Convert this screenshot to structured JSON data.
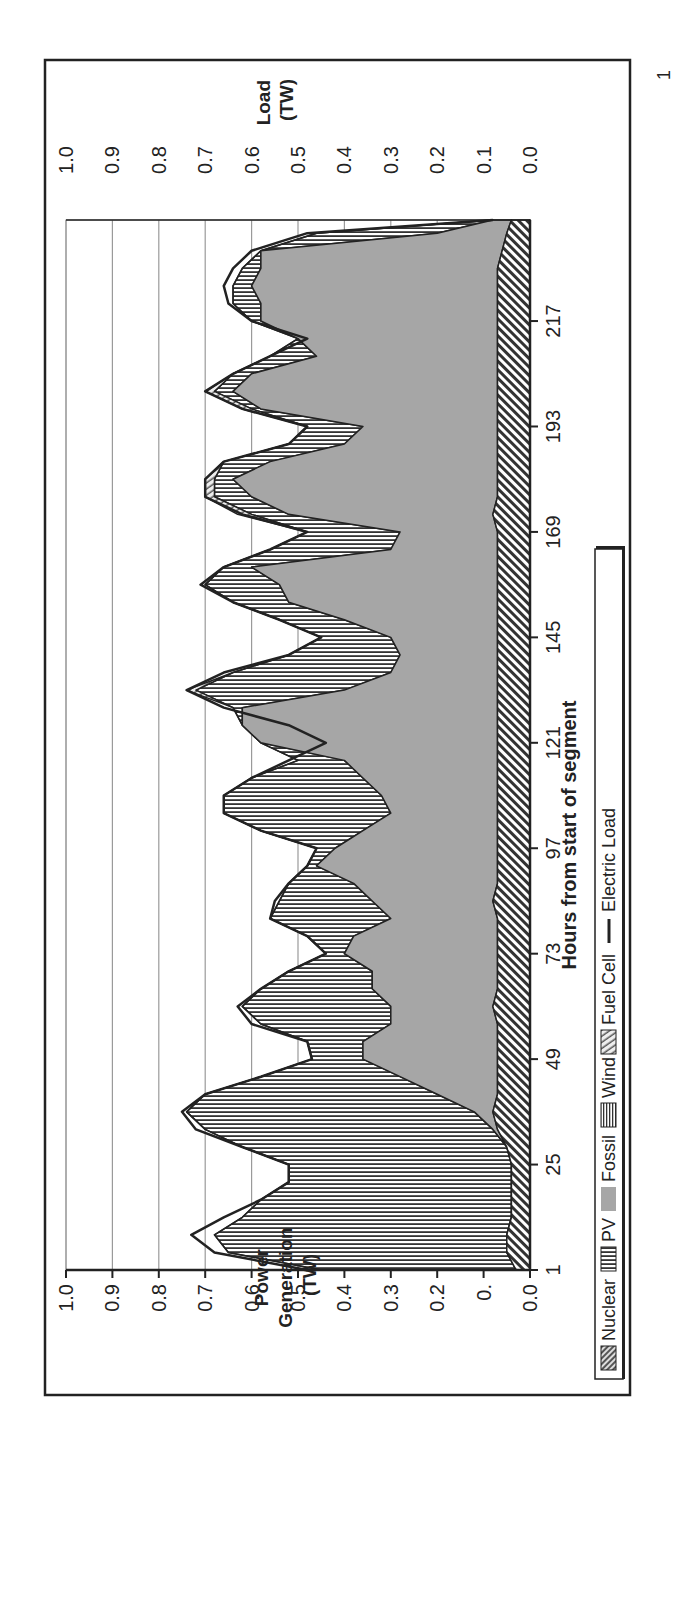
{
  "chart_data": {
    "type": "area",
    "orientation_in_image": "rotated 90 degrees counter-clockwise",
    "title": "",
    "xlabel": "Hours from start of segment",
    "ylabel_left": "Power Generation (TW)",
    "ylabel_right": "Load (TW)",
    "x_ticks": [
      1,
      25,
      49,
      73,
      97,
      121,
      145,
      169,
      193,
      217
    ],
    "x_range": [
      1,
      240
    ],
    "y_ticks_left": [
      "1.0",
      "0.9",
      "0.8",
      "0.7",
      "0.6",
      "0.5",
      "0.4",
      "0.3",
      "0.2",
      "0.",
      "0.0"
    ],
    "y_ticks_right": [
      "1.0",
      "0.9",
      "0.8",
      "0.7",
      "0.6",
      "0.5",
      "0.4",
      "0.3",
      "0.2",
      "0.1",
      "0.0"
    ],
    "ylim": [
      0,
      1.0
    ],
    "grid": "horizontal gridlines at 0.1 steps (0.5–1.0 visible above data)",
    "legend_position": "bottom",
    "legend": [
      "Nuclear",
      "PV",
      "Fossil",
      "Wind",
      "Fuel Cell",
      "Electric Load"
    ],
    "stacking_order_bottom_to_top": [
      "Nuclear",
      "Wind",
      "Fossil",
      "PV",
      "Fuel Cell"
    ],
    "x": [
      1,
      5,
      9,
      13,
      17,
      21,
      25,
      29,
      33,
      37,
      41,
      45,
      49,
      53,
      57,
      61,
      65,
      69,
      73,
      77,
      81,
      85,
      89,
      93,
      97,
      101,
      105,
      109,
      113,
      117,
      121,
      125,
      129,
      133,
      137,
      141,
      145,
      149,
      153,
      157,
      161,
      165,
      169,
      173,
      177,
      181,
      185,
      189,
      193,
      197,
      201,
      205,
      209,
      213,
      217,
      221,
      225,
      229,
      233,
      237,
      240
    ],
    "series": [
      {
        "name": "Nuclear",
        "values": [
          0.0,
          0.0,
          0.0,
          0.0,
          0.0,
          0.0,
          0.0,
          0.0,
          0.0,
          0.0,
          0.0,
          0.0,
          0.0,
          0.0,
          0.0,
          0.0,
          0.0,
          0.0,
          0.0,
          0.0,
          0.0,
          0.0,
          0.0,
          0.0,
          0.0,
          0.0,
          0.0,
          0.0,
          0.0,
          0.0,
          0.0,
          0.0,
          0.0,
          0.0,
          0.0,
          0.0,
          0.0,
          0.0,
          0.0,
          0.0,
          0.0,
          0.0,
          0.0,
          0.0,
          0.0,
          0.0,
          0.0,
          0.0,
          0.0,
          0.0,
          0.0,
          0.0,
          0.0,
          0.0,
          0.0,
          0.0,
          0.0,
          0.0,
          0.0,
          0.0,
          0.0
        ]
      },
      {
        "name": "Wind",
        "values": [
          0.03,
          0.05,
          0.05,
          0.04,
          0.04,
          0.04,
          0.04,
          0.05,
          0.07,
          0.08,
          0.07,
          0.07,
          0.07,
          0.07,
          0.07,
          0.08,
          0.07,
          0.07,
          0.07,
          0.07,
          0.07,
          0.08,
          0.07,
          0.07,
          0.07,
          0.07,
          0.07,
          0.07,
          0.07,
          0.07,
          0.07,
          0.07,
          0.07,
          0.07,
          0.07,
          0.07,
          0.07,
          0.07,
          0.07,
          0.07,
          0.07,
          0.07,
          0.07,
          0.08,
          0.07,
          0.07,
          0.07,
          0.07,
          0.07,
          0.07,
          0.07,
          0.07,
          0.07,
          0.07,
          0.07,
          0.07,
          0.07,
          0.07,
          0.06,
          0.05,
          0.04
        ]
      },
      {
        "name": "Fossil",
        "values": [
          0.03,
          0.05,
          0.05,
          0.04,
          0.04,
          0.04,
          0.04,
          0.05,
          0.08,
          0.12,
          0.2,
          0.28,
          0.36,
          0.36,
          0.3,
          0.3,
          0.34,
          0.34,
          0.4,
          0.38,
          0.3,
          0.34,
          0.38,
          0.46,
          0.42,
          0.36,
          0.3,
          0.32,
          0.36,
          0.4,
          0.58,
          0.62,
          0.62,
          0.4,
          0.3,
          0.28,
          0.3,
          0.4,
          0.52,
          0.54,
          0.6,
          0.3,
          0.28,
          0.52,
          0.6,
          0.64,
          0.56,
          0.4,
          0.36,
          0.58,
          0.64,
          0.6,
          0.46,
          0.5,
          0.58,
          0.58,
          0.6,
          0.58,
          0.58,
          0.2,
          0.08
        ]
      },
      {
        "name": "PV",
        "values": [
          0.45,
          0.65,
          0.68,
          0.62,
          0.58,
          0.52,
          0.52,
          0.62,
          0.7,
          0.74,
          0.7,
          0.58,
          0.47,
          0.48,
          0.58,
          0.62,
          0.58,
          0.52,
          0.44,
          0.48,
          0.56,
          0.54,
          0.52,
          0.48,
          0.46,
          0.58,
          0.66,
          0.66,
          0.6,
          0.5,
          0.44,
          0.5,
          0.64,
          0.72,
          0.64,
          0.52,
          0.45,
          0.54,
          0.64,
          0.7,
          0.66,
          0.56,
          0.48,
          0.6,
          0.68,
          0.68,
          0.66,
          0.52,
          0.48,
          0.6,
          0.68,
          0.64,
          0.56,
          0.48,
          0.6,
          0.64,
          0.64,
          0.62,
          0.58,
          0.46,
          0.06
        ]
      },
      {
        "name": "Fuel Cell",
        "values": [
          0,
          0,
          0,
          0,
          0,
          0,
          0,
          0,
          0,
          0,
          0,
          0,
          0,
          0,
          0,
          0,
          0,
          0,
          0,
          0,
          0,
          0,
          0,
          0,
          0,
          0,
          0,
          0,
          0,
          0,
          0,
          0,
          0,
          0.02,
          0,
          0,
          0,
          0,
          0,
          0,
          0,
          0,
          0,
          0.03,
          0.02,
          0.02,
          0,
          0,
          0,
          0.02,
          0.02,
          0,
          0,
          0,
          0,
          0,
          0,
          0,
          0,
          0,
          0
        ]
      },
      {
        "name": "Electric Load",
        "values": [
          0.48,
          0.68,
          0.73,
          0.66,
          0.58,
          0.52,
          0.52,
          0.62,
          0.72,
          0.75,
          0.7,
          0.58,
          0.47,
          0.48,
          0.6,
          0.63,
          0.58,
          0.52,
          0.44,
          0.48,
          0.56,
          0.55,
          0.52,
          0.48,
          0.46,
          0.58,
          0.66,
          0.66,
          0.6,
          0.52,
          0.44,
          0.52,
          0.66,
          0.74,
          0.66,
          0.52,
          0.45,
          0.54,
          0.64,
          0.71,
          0.66,
          0.56,
          0.48,
          0.62,
          0.7,
          0.7,
          0.66,
          0.52,
          0.48,
          0.62,
          0.7,
          0.64,
          0.56,
          0.48,
          0.6,
          0.65,
          0.66,
          0.64,
          0.6,
          0.48,
          0.08
        ]
      }
    ]
  },
  "axes": {
    "left_label_line1": "Power",
    "left_label_line2": "Generation",
    "left_label_line3": "(TW)",
    "right_label_line1": "Load",
    "right_label_line2": "(TW)",
    "x_label": "Hours from start of segment",
    "page_number": "1"
  },
  "legend": {
    "nuclear": "Nuclear",
    "pv": "PV",
    "fossil": "Fossil",
    "wind": "Wind",
    "fuel_cell": "Fuel Cell",
    "electric_load": "Electric Load"
  },
  "colors": {
    "fossil_fill": "#a6a6a6",
    "line": "#222222",
    "grid": "#9a9a9a",
    "frame": "#222222"
  }
}
